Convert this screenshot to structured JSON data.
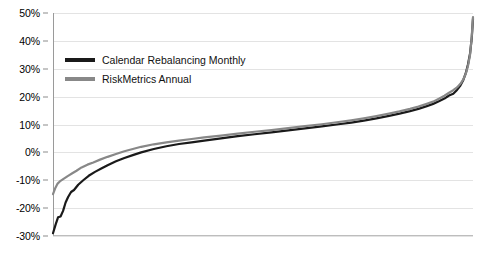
{
  "chart_data": {
    "type": "line",
    "title": "",
    "subtitle": "",
    "xlabel": "",
    "ylabel": "",
    "ylim": [
      -30,
      50
    ],
    "xlim": [
      0,
      100
    ],
    "grid": true,
    "y_ticks": [
      50,
      40,
      30,
      20,
      10,
      0,
      -10,
      -20,
      -30
    ],
    "y_tick_labels": [
      "50%",
      "40%",
      "30%",
      "20%",
      "10%",
      "0%",
      "-10%",
      "-20%",
      "-30%"
    ],
    "x_tick_labels": [],
    "legend_position": "upper-left-inside",
    "series": [
      {
        "name": "Calendar Rebalancing Monthly",
        "color": "#1a1a1a",
        "x": [
          0,
          0.6,
          1.2,
          1.8,
          2.4,
          3.0,
          3.6,
          4.3,
          5.0,
          6.0,
          7.2,
          8.5,
          10.0,
          11.5,
          13.0,
          15.0,
          17.0,
          19.0,
          21.0,
          24.0,
          27.0,
          30.0,
          33.0,
          36.0,
          40.0,
          44.0,
          48.0,
          52.0,
          56.0,
          60.0,
          64.0,
          68.0,
          71.0,
          74.0,
          77.0,
          80.0,
          82.5,
          85.0,
          87.0,
          89.0,
          90.5,
          92.0,
          93.2,
          94.3,
          95.3,
          96.2,
          97.0,
          97.7,
          98.3,
          98.8,
          99.3,
          99.7,
          100.0
        ],
        "values": [
          -29.0,
          -26.0,
          -23.3,
          -23.0,
          -21.0,
          -18.0,
          -16.0,
          -14.2,
          -13.5,
          -11.6,
          -10.0,
          -8.4,
          -7.0,
          -5.8,
          -4.6,
          -3.2,
          -2.0,
          -1.0,
          0.0,
          1.2,
          2.2,
          3.0,
          3.6,
          4.2,
          5.0,
          5.8,
          6.5,
          7.2,
          7.9,
          8.6,
          9.3,
          10.1,
          10.7,
          11.4,
          12.2,
          13.1,
          13.9,
          14.8,
          15.6,
          16.6,
          17.4,
          18.4,
          19.3,
          20.4,
          21.0,
          22.4,
          24.0,
          26.0,
          28.5,
          31.5,
          35.5,
          41.0,
          48.0
        ]
      },
      {
        "name": "RiskMetrics Annual",
        "color": "#888888",
        "x": [
          0,
          0.5,
          1.1,
          1.8,
          2.6,
          3.5,
          4.5,
          5.6,
          6.8,
          8.2,
          9.6,
          11.2,
          13.0,
          15.0,
          17.0,
          19.0,
          21.0,
          24.0,
          27.0,
          30.0,
          33.0,
          36.0,
          40.0,
          44.0,
          48.0,
          52.0,
          56.0,
          60.0,
          64.0,
          68.0,
          71.0,
          74.0,
          77.0,
          80.0,
          82.5,
          85.0,
          87.0,
          89.0,
          90.5,
          92.0,
          93.2,
          94.3,
          95.3,
          96.2,
          97.0,
          97.7,
          98.3,
          98.8,
          99.3,
          99.7,
          100.0
        ],
        "values": [
          -15.0,
          -13.0,
          -11.2,
          -10.2,
          -9.4,
          -8.5,
          -7.6,
          -6.6,
          -5.4,
          -4.4,
          -3.6,
          -2.6,
          -1.6,
          -0.6,
          0.4,
          1.2,
          2.0,
          2.9,
          3.6,
          4.2,
          4.8,
          5.4,
          6.0,
          6.7,
          7.4,
          8.0,
          8.7,
          9.4,
          10.1,
          10.9,
          11.5,
          12.2,
          13.0,
          13.9,
          14.7,
          15.6,
          16.4,
          17.4,
          18.2,
          19.3,
          20.3,
          21.4,
          22.3,
          23.3,
          24.6,
          26.2,
          28.3,
          31.0,
          35.0,
          41.5,
          48.5
        ]
      }
    ]
  },
  "legend": {
    "items": [
      {
        "label": "Calendar Rebalancing Monthly",
        "color": "#1a1a1a"
      },
      {
        "label": "RiskMetrics Annual",
        "color": "#888888"
      }
    ]
  },
  "axis": {
    "y_labels": [
      "50%",
      "40%",
      "30%",
      "20%",
      "10%",
      "0%",
      "-10%",
      "-20%",
      "-30%"
    ]
  }
}
